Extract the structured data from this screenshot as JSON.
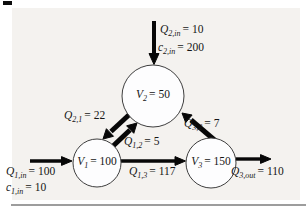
{
  "figure": {
    "kind": "mass-balance-flow-diagram"
  },
  "colors": {
    "panel_background": "#f4f2ef",
    "page_background": "#ffffff",
    "arrow": "#070707",
    "node_fill": "#fdfdfe",
    "node_stroke": "#3e3e3e",
    "text": "#161616",
    "bottom_rule": "#9d9d9d"
  },
  "labels": {
    "q2in": {
      "var": "Q",
      "sub": "2,in",
      "eq": "= 10"
    },
    "c2in": {
      "var": "c",
      "sub": "2,in",
      "eq": "= 200"
    },
    "v2": {
      "var": "V",
      "sub": "2",
      "eq": "= 50"
    },
    "q21": {
      "var": "Q",
      "sub": "2,1",
      "eq": "= 22"
    },
    "q12": {
      "var": "Q",
      "sub": "1,2",
      "eq": "= 5"
    },
    "q32": {
      "var": "Q",
      "sub": "3,2",
      "eq": "= 7"
    },
    "v1": {
      "var": "V",
      "sub": "1",
      "eq": "= 100"
    },
    "v3": {
      "var": "V",
      "sub": "3",
      "eq": "= 150"
    },
    "q13": {
      "var": "Q",
      "sub": "1,3",
      "eq": "= 117"
    },
    "q1in": {
      "var": "Q",
      "sub": "1,in",
      "eq": "= 100"
    },
    "c1in": {
      "var": "c",
      "sub": "1,in",
      "eq": "= 10"
    },
    "q3out": {
      "var": "Q",
      "sub": "3,out",
      "eq": "= 110"
    }
  },
  "nodes": [
    {
      "id": "V1",
      "volume": "100"
    },
    {
      "id": "V2",
      "volume": "50"
    },
    {
      "id": "V3",
      "volume": "150"
    }
  ],
  "flows": [
    {
      "name": "Q2,in",
      "from": "external",
      "to": "V2",
      "value": "10",
      "concentration": "200"
    },
    {
      "name": "Q1,in",
      "from": "external",
      "to": "V1",
      "value": "100",
      "concentration": "10"
    },
    {
      "name": "Q2,1",
      "from": "V2",
      "to": "V1",
      "value": "22"
    },
    {
      "name": "Q1,2",
      "from": "V1",
      "to": "V2",
      "value": "5"
    },
    {
      "name": "Q3,2",
      "from": "V3",
      "to": "V2",
      "value": "7"
    },
    {
      "name": "Q1,3",
      "from": "V1",
      "to": "V3",
      "value": "117"
    },
    {
      "name": "Q3,out",
      "from": "V3",
      "to": "external",
      "value": "110"
    }
  ]
}
